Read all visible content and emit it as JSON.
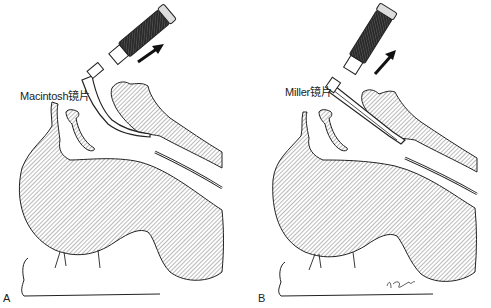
{
  "figure": {
    "panels": [
      {
        "id": "A",
        "letter": "A",
        "blade_label": "Macintosh镜片",
        "blade_type": "curved",
        "arrow_direction": "up-right"
      },
      {
        "id": "B",
        "letter": "B",
        "blade_label": "Miller镜片",
        "blade_type": "straight",
        "arrow_direction": "up-right",
        "signature": "K.Powell"
      }
    ]
  },
  "colors": {
    "line": "#222222",
    "hatch": "#555555",
    "background": "#ffffff",
    "handle_dark": "#333333"
  }
}
